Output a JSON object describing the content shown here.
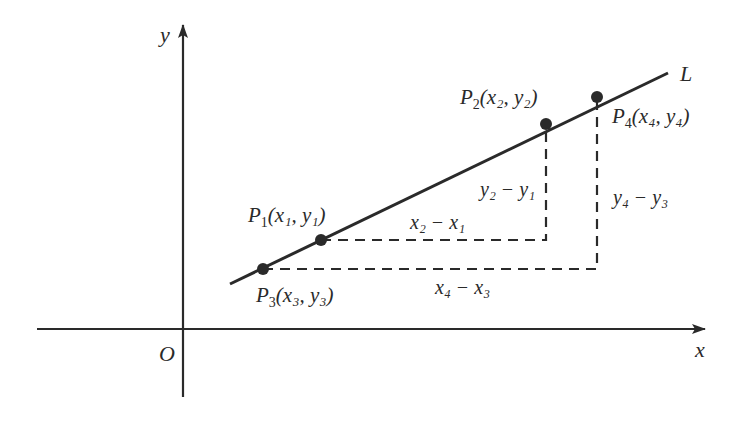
{
  "diagram": {
    "type": "coordinate-geometry",
    "axes": {
      "x_label": "x",
      "y_label": "y",
      "origin_label": "O"
    },
    "line": {
      "label": "L"
    },
    "points": [
      {
        "id": "P1",
        "name": "P",
        "index": "1",
        "coord": "(x₁, y₁)"
      },
      {
        "id": "P2",
        "name": "P",
        "index": "2",
        "coord": "(x₂, y₂)"
      },
      {
        "id": "P3",
        "name": "P",
        "index": "3",
        "coord": "(x₃, y₃)"
      },
      {
        "id": "P4",
        "name": "P",
        "index": "4",
        "coord": "(x₄, y₄)"
      }
    ],
    "differences": {
      "dx_12": "x₂ − x₁",
      "dy_12": "y₂ − y₁",
      "dx_34": "x₄ − x₃",
      "dy_34": "y₄ − y₃"
    },
    "colors": {
      "ink": "#2a2a2a",
      "background": "#ffffff"
    }
  }
}
